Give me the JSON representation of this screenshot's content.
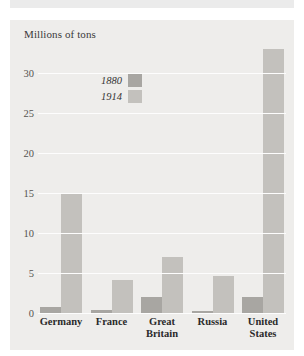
{
  "chart_data": {
    "type": "bar",
    "title": "",
    "subtitle": "",
    "xlabel": "",
    "ylabel": "Millions of tons",
    "ylim": [
      0,
      34.125
    ],
    "yticks": [
      0,
      5,
      10,
      15,
      20,
      25,
      30
    ],
    "ytick_labels": [
      "0",
      "5",
      "10",
      "15",
      "20",
      "25",
      "30"
    ],
    "grid": "horizontal",
    "legend_position": "upper-left-inside",
    "categories": [
      "Germany",
      "France",
      "Great Britain",
      "Russia",
      "United States"
    ],
    "category_lines": [
      [
        "Germany"
      ],
      [
        "France"
      ],
      [
        "Great",
        "Britain"
      ],
      [
        "Russia"
      ],
      [
        "United",
        "States"
      ]
    ],
    "series": [
      {
        "name": "1880",
        "color": "#a8a6a2",
        "values": [
          0.7,
          0.4,
          2.0,
          0.3,
          2.0
        ]
      },
      {
        "name": "1914",
        "color": "#c3c1bd",
        "values": [
          15.0,
          4.1,
          7.0,
          4.6,
          33.0
        ]
      }
    ]
  },
  "colors": {
    "panel_background": "#eeedeb",
    "page_background": "#ffffff",
    "gridline": "#fdfdfd",
    "series_1880": "#a8a6a2",
    "series_1914": "#c3c1bd",
    "tick_text": "#55534f",
    "label_text": "#2a2a2a"
  }
}
